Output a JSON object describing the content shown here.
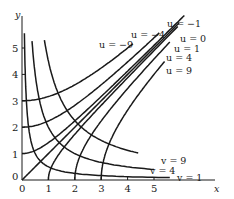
{
  "figure": {
    "type": "orthogonal hyperbola families",
    "axes": {
      "x_label": "x",
      "y_label": "y",
      "x_ticks": [
        "0",
        "1",
        "2",
        "3",
        "4",
        "5"
      ],
      "y_ticks": [
        "0",
        "1",
        "2",
        "3",
        "4",
        "5"
      ]
    },
    "u_curves": [
      {
        "value": -9,
        "label": "u = −9",
        "x_end": 4.2
      },
      {
        "value": -4,
        "label": "u = −4",
        "x_end": 5.2
      },
      {
        "value": -1,
        "label": "u = −1",
        "x_end": 6.15
      },
      {
        "value": 0,
        "label": "u = 0",
        "x_end": 5.95
      },
      {
        "value": 1,
        "label": "u = 1",
        "x_end": 5.9
      },
      {
        "value": 4,
        "label": "u = 4",
        "x_end": 5.6
      },
      {
        "value": 9,
        "label": "u = 9",
        "x_end": 5.4
      }
    ],
    "v_curves": [
      {
        "value": 1,
        "label": "v = 1",
        "x_start": 0.09,
        "x_end": 5.6
      },
      {
        "value": 4,
        "label": "v = 4",
        "x_start": 0.38,
        "x_end": 5.0
      },
      {
        "value": 9,
        "label": "v = 9",
        "x_start": 0.85,
        "x_end": 4.4
      }
    ],
    "ink_color": "#1a1a1a"
  }
}
